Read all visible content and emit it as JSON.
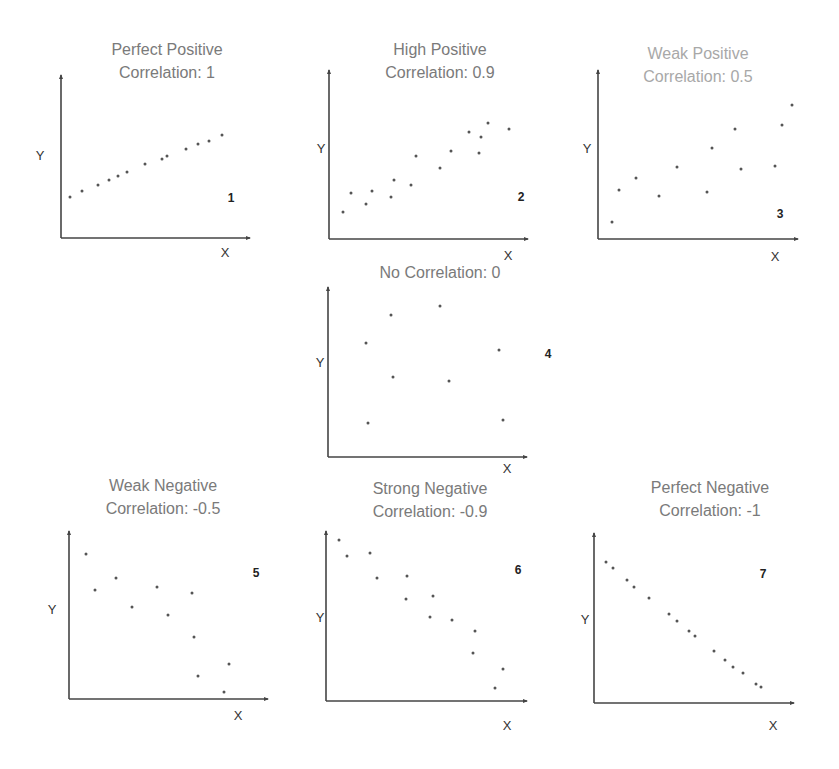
{
  "colors": {
    "axis": "#444444",
    "point": "#555555",
    "title": "#7a7a7a",
    "title_light": "#a8a8a8"
  },
  "chart_data": [
    {
      "type": "scatter",
      "id": 1,
      "title": "Perfect Positive Correlation: 1",
      "title_lines": [
        "Perfect Positive",
        "Correlation: 1"
      ],
      "xlabel": "X",
      "ylabel": "Y",
      "panel_number": "1",
      "correlation": 1,
      "frame": {
        "ox": 61,
        "oy": 238,
        "top": 75,
        "right": 250
      },
      "title_pos": {
        "x": 167,
        "y": 38
      },
      "xlabel_pos": {
        "x": 225,
        "y": 252
      },
      "ylabel_pos": {
        "x": 40,
        "y": 155
      },
      "num_pos": {
        "x": 231,
        "y": 198
      },
      "points": [
        [
          70,
          197
        ],
        [
          82,
          191
        ],
        [
          98,
          185
        ],
        [
          109,
          180
        ],
        [
          118,
          176
        ],
        [
          127,
          172
        ],
        [
          145,
          164
        ],
        [
          162,
          159
        ],
        [
          167,
          156
        ],
        [
          186,
          149
        ],
        [
          198,
          144
        ],
        [
          209,
          141
        ],
        [
          222,
          135
        ]
      ]
    },
    {
      "type": "scatter",
      "id": 2,
      "title": "High Positive Correlation: 0.9",
      "title_lines": [
        "High Positive",
        "Correlation: 0.9"
      ],
      "xlabel": "X",
      "ylabel": "Y",
      "panel_number": "2",
      "correlation": 0.9,
      "frame": {
        "ox": 329,
        "oy": 239,
        "top": 70,
        "right": 528
      },
      "title_pos": {
        "x": 440,
        "y": 38
      },
      "xlabel_pos": {
        "x": 508,
        "y": 255
      },
      "ylabel_pos": {
        "x": 321,
        "y": 148
      },
      "num_pos": {
        "x": 521,
        "y": 197
      },
      "points": [
        [
          343,
          212
        ],
        [
          351,
          193
        ],
        [
          366,
          204
        ],
        [
          372,
          191
        ],
        [
          391,
          197
        ],
        [
          394,
          180
        ],
        [
          411,
          185
        ],
        [
          416,
          156
        ],
        [
          440,
          168
        ],
        [
          451,
          151
        ],
        [
          469,
          132
        ],
        [
          479,
          153
        ],
        [
          481,
          137
        ],
        [
          488,
          123
        ],
        [
          509,
          129
        ]
      ]
    },
    {
      "type": "scatter",
      "id": 3,
      "title": "Weak Positive Correlation: 0.5",
      "title_lines": [
        "Weak Positive",
        "Correlation: 0.5"
      ],
      "xlabel": "X",
      "ylabel": "Y",
      "panel_number": "3",
      "correlation": 0.5,
      "frame": {
        "ox": 598,
        "oy": 239,
        "top": 70,
        "right": 798
      },
      "title_pos": {
        "x": 698,
        "y": 42
      },
      "xlabel_pos": {
        "x": 775,
        "y": 256
      },
      "ylabel_pos": {
        "x": 587,
        "y": 148
      },
      "num_pos": {
        "x": 780,
        "y": 214
      },
      "points": [
        [
          612,
          222
        ],
        [
          619,
          190
        ],
        [
          636,
          178
        ],
        [
          659,
          196
        ],
        [
          677,
          167
        ],
        [
          707,
          192
        ],
        [
          712,
          148
        ],
        [
          735,
          129
        ],
        [
          741,
          169
        ],
        [
          775,
          166
        ],
        [
          782,
          125
        ],
        [
          792,
          105
        ]
      ]
    },
    {
      "type": "scatter",
      "id": 4,
      "title": "No Correlation: 0",
      "title_lines": [
        "No Correlation: 0"
      ],
      "xlabel": "X",
      "ylabel": "Y",
      "panel_number": "4",
      "correlation": 0,
      "frame": {
        "ox": 328,
        "oy": 457,
        "top": 287,
        "right": 527
      },
      "title_pos": {
        "x": 440,
        "y": 261
      },
      "xlabel_pos": {
        "x": 507,
        "y": 468
      },
      "ylabel_pos": {
        "x": 320,
        "y": 362
      },
      "num_pos": {
        "x": 548,
        "y": 354
      },
      "points": [
        [
          366,
          343
        ],
        [
          391,
          315
        ],
        [
          440,
          306
        ],
        [
          393,
          377
        ],
        [
          449,
          381
        ],
        [
          499,
          350
        ],
        [
          368,
          423
        ],
        [
          503,
          420
        ]
      ]
    },
    {
      "type": "scatter",
      "id": 5,
      "title": "Weak Negative Correlation: -0.5",
      "title_lines": [
        "Weak Negative",
        "Correlation: -0.5"
      ],
      "xlabel": "X",
      "ylabel": "Y",
      "panel_number": "5",
      "correlation": -0.5,
      "frame": {
        "ox": 69,
        "oy": 699,
        "top": 531,
        "right": 268
      },
      "title_pos": {
        "x": 163,
        "y": 474
      },
      "xlabel_pos": {
        "x": 238,
        "y": 715
      },
      "ylabel_pos": {
        "x": 52,
        "y": 609
      },
      "num_pos": {
        "x": 256,
        "y": 573
      },
      "points": [
        [
          86,
          554
        ],
        [
          95,
          590
        ],
        [
          116,
          578
        ],
        [
          132,
          607
        ],
        [
          157,
          587
        ],
        [
          168,
          615
        ],
        [
          192,
          593
        ],
        [
          194,
          637
        ],
        [
          198,
          676
        ],
        [
          229,
          664
        ],
        [
          224,
          692
        ]
      ]
    },
    {
      "type": "scatter",
      "id": 6,
      "title": "Strong Negative Correlation: -0.9",
      "title_lines": [
        "Strong Negative",
        "Correlation: -0.9"
      ],
      "xlabel": "X",
      "ylabel": "Y",
      "panel_number": "6",
      "correlation": -0.9,
      "frame": {
        "ox": 326,
        "oy": 701,
        "top": 531,
        "right": 527
      },
      "title_pos": {
        "x": 430,
        "y": 477
      },
      "xlabel_pos": {
        "x": 507,
        "y": 725
      },
      "ylabel_pos": {
        "x": 320,
        "y": 617
      },
      "num_pos": {
        "x": 518,
        "y": 570
      },
      "points": [
        [
          339,
          540
        ],
        [
          347,
          556
        ],
        [
          370,
          553
        ],
        [
          377,
          578
        ],
        [
          407,
          576
        ],
        [
          406,
          599
        ],
        [
          433,
          596
        ],
        [
          430,
          617
        ],
        [
          452,
          620
        ],
        [
          475,
          631
        ],
        [
          473,
          653
        ],
        [
          503,
          669
        ],
        [
          495,
          688
        ]
      ]
    },
    {
      "type": "scatter",
      "id": 7,
      "title": "Perfect Negative Correlation: -1",
      "title_lines": [
        "Perfect Negative",
        "Correlation: -1"
      ],
      "xlabel": "X",
      "ylabel": "Y",
      "panel_number": "7",
      "correlation": -1,
      "frame": {
        "ox": 594,
        "oy": 703,
        "top": 533,
        "right": 794
      },
      "title_pos": {
        "x": 710,
        "y": 476
      },
      "xlabel_pos": {
        "x": 773,
        "y": 725
      },
      "ylabel_pos": {
        "x": 585,
        "y": 619
      },
      "num_pos": {
        "x": 763,
        "y": 574
      },
      "points": [
        [
          606,
          562
        ],
        [
          613,
          568
        ],
        [
          627,
          580
        ],
        [
          634,
          587
        ],
        [
          649,
          598
        ],
        [
          669,
          614
        ],
        [
          677,
          621
        ],
        [
          689,
          631
        ],
        [
          695,
          636
        ],
        [
          714,
          651
        ],
        [
          725,
          660
        ],
        [
          733,
          667
        ],
        [
          743,
          673
        ],
        [
          756,
          684
        ],
        [
          761,
          687
        ]
      ]
    }
  ]
}
